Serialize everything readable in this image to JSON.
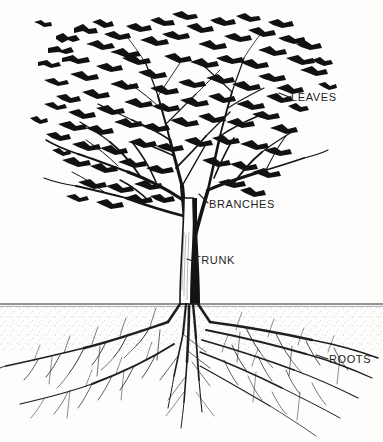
{
  "diagram": {
    "style": "pen-and-ink botanical illustration",
    "background_color": "#fdfdfc",
    "ink_color": "#1d1d1d",
    "ground_line_y": 304
  },
  "labels": {
    "leaves": "LEAVES",
    "branches": "BRANCHES",
    "trunk": "TRUNK",
    "roots": "ROOTS"
  },
  "parts": [
    {
      "id": "leaves",
      "label": "LEAVES",
      "region": "canopy",
      "label_x": 291,
      "label_y": 92
    },
    {
      "id": "branches",
      "label": "BRANCHES",
      "region": "mid-crown",
      "label_x": 209,
      "label_y": 199
    },
    {
      "id": "trunk",
      "label": "TRUNK",
      "region": "stem",
      "label_x": 194,
      "label_y": 255
    },
    {
      "id": "roots",
      "label": "ROOTS",
      "region": "below-ground",
      "label_x": 329,
      "label_y": 354
    }
  ]
}
